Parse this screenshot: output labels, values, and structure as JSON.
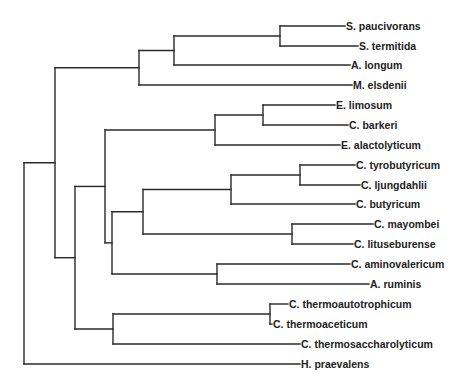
{
  "figure": {
    "type": "phylogenetic-tree",
    "line_color": "#2a2a2a",
    "label_color": "#222222",
    "background": "#ffffff"
  },
  "leaves": [
    {
      "id": "spau",
      "label": "S. paucivorans",
      "y": 26,
      "x_end": 345
    },
    {
      "id": "ster",
      "label": "S. termitida",
      "y": 46,
      "x_end": 358
    },
    {
      "id": "alon",
      "label": "A. longum",
      "y": 65,
      "x_end": 350
    },
    {
      "id": "mels",
      "label": "M. elsdenii",
      "y": 85,
      "x_end": 352
    },
    {
      "id": "elim",
      "label": "E. limosum",
      "y": 105,
      "x_end": 335
    },
    {
      "id": "cbar",
      "label": "C. barkeri",
      "y": 125,
      "x_end": 348
    },
    {
      "id": "eala",
      "label": "E. alactolyticum",
      "y": 145,
      "x_end": 340
    },
    {
      "id": "ctyr",
      "label": "C. tyrobutyricum",
      "y": 165,
      "x_end": 355
    },
    {
      "id": "clju",
      "label": "C. ljungdahlii",
      "y": 185,
      "x_end": 360
    },
    {
      "id": "cbut",
      "label": "C. butyricum",
      "y": 204,
      "x_end": 355
    },
    {
      "id": "cmay",
      "label": "C. mayombei",
      "y": 224,
      "x_end": 373
    },
    {
      "id": "clit",
      "label": "C. lituseburense",
      "y": 244,
      "x_end": 353
    },
    {
      "id": "cami",
      "label": "C. aminovalericum",
      "y": 264,
      "x_end": 350
    },
    {
      "id": "arum",
      "label": "A. ruminis",
      "y": 284,
      "x_end": 369
    },
    {
      "id": "ctha",
      "label": "C. thermoautotrophicum",
      "y": 304,
      "x_end": 288
    },
    {
      "id": "cthe",
      "label": "C. thermoaceticum",
      "y": 324,
      "x_end": 272
    },
    {
      "id": "cths",
      "label": "C. thermosaccharolyticum",
      "y": 344,
      "x_end": 300
    },
    {
      "id": "hpra",
      "label": "H. praevalens",
      "y": 364,
      "x_end": 300
    }
  ],
  "nodes": [
    {
      "id": "n_spau_ster",
      "x": 280,
      "children": [
        {
          "leaf": "spau"
        },
        {
          "leaf": "ster"
        }
      ]
    },
    {
      "id": "n_sel_alon",
      "x": 174,
      "children": [
        {
          "node": "n_spau_ster"
        },
        {
          "leaf": "alon"
        }
      ]
    },
    {
      "id": "n_sel_mels",
      "x": 139,
      "children": [
        {
          "node": "n_sel_alon"
        },
        {
          "leaf": "mels"
        }
      ]
    },
    {
      "id": "n_elim_cbar",
      "x": 263,
      "children": [
        {
          "leaf": "elim"
        },
        {
          "leaf": "cbar"
        }
      ]
    },
    {
      "id": "n_eub",
      "x": 215,
      "children": [
        {
          "node": "n_elim_cbar"
        },
        {
          "leaf": "eala"
        }
      ]
    },
    {
      "id": "n_ctyr_clju",
      "x": 300,
      "children": [
        {
          "leaf": "ctyr"
        },
        {
          "leaf": "clju"
        }
      ]
    },
    {
      "id": "n_but",
      "x": 231,
      "children": [
        {
          "node": "n_ctyr_clju"
        },
        {
          "leaf": "cbut"
        }
      ]
    },
    {
      "id": "n_cmay_clit",
      "x": 292,
      "children": [
        {
          "leaf": "cmay"
        },
        {
          "leaf": "clit"
        }
      ]
    },
    {
      "id": "n_c1",
      "x": 143,
      "children": [
        {
          "node": "n_but"
        },
        {
          "node": "n_cmay_clit"
        }
      ]
    },
    {
      "id": "n_cami_arum",
      "x": 217,
      "children": [
        {
          "leaf": "cami"
        },
        {
          "leaf": "arum"
        }
      ]
    },
    {
      "id": "n_c2",
      "x": 112,
      "children": [
        {
          "node": "n_c1"
        },
        {
          "node": "n_cami_arum"
        }
      ]
    },
    {
      "id": "n_c3",
      "x": 105,
      "children": [
        {
          "node": "n_eub"
        },
        {
          "node": "n_c2"
        }
      ]
    },
    {
      "id": "n_tha_the",
      "x": 270,
      "children": [
        {
          "leaf": "ctha"
        },
        {
          "leaf": "cthe"
        }
      ]
    },
    {
      "id": "n_thermo",
      "x": 113,
      "children": [
        {
          "node": "n_tha_the"
        },
        {
          "leaf": "cths"
        }
      ]
    },
    {
      "id": "n_c4",
      "x": 75,
      "children": [
        {
          "node": "n_c3"
        },
        {
          "node": "n_thermo"
        }
      ]
    },
    {
      "id": "n_c5",
      "x": 55,
      "children": [
        {
          "node": "n_sel_mels"
        },
        {
          "node": "n_c4"
        }
      ]
    },
    {
      "id": "n_root",
      "x": 24,
      "children": [
        {
          "node": "n_c5"
        },
        {
          "leaf": "hpra"
        }
      ]
    }
  ],
  "root": "n_root"
}
